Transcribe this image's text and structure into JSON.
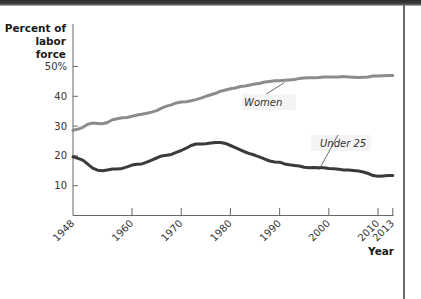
{
  "chart_data": {
    "type": "line",
    "title": "",
    "ylabel": "Percent of labor force",
    "xlabel": "Year",
    "ylim": [
      0,
      50
    ],
    "xlim": [
      1948,
      2013
    ],
    "grid": false,
    "legend": "inline labels",
    "y_ticks": [
      {
        "value": 10,
        "label": "10"
      },
      {
        "value": 20,
        "label": "20"
      },
      {
        "value": 30,
        "label": "30"
      },
      {
        "value": 40,
        "label": "40"
      },
      {
        "value": 50,
        "label": "50%"
      }
    ],
    "x_ticks": [
      {
        "value": 1948,
        "label": "1948"
      },
      {
        "value": 1960,
        "label": "1960"
      },
      {
        "value": 1970,
        "label": "1970"
      },
      {
        "value": 1980,
        "label": "1980"
      },
      {
        "value": 1990,
        "label": "1990"
      },
      {
        "value": 2000,
        "label": "2000"
      },
      {
        "value": 2010,
        "label": "2010"
      },
      {
        "value": 2013,
        "label": "2013"
      }
    ],
    "series": [
      {
        "name": "Women",
        "color": "#8c8c8c",
        "x": [
          1948,
          1949,
          1950,
          1951,
          1952,
          1953,
          1954,
          1955,
          1956,
          1957,
          1958,
          1959,
          1960,
          1961,
          1962,
          1963,
          1964,
          1965,
          1966,
          1967,
          1968,
          1969,
          1970,
          1971,
          1972,
          1973,
          1974,
          1975,
          1976,
          1977,
          1978,
          1979,
          1980,
          1981,
          1982,
          1983,
          1984,
          1985,
          1986,
          1987,
          1988,
          1989,
          1990,
          1991,
          1992,
          1993,
          1994,
          1995,
          1996,
          1997,
          1998,
          1999,
          2000,
          2001,
          2002,
          2003,
          2004,
          2005,
          2006,
          2007,
          2008,
          2009,
          2010,
          2011,
          2012,
          2013
        ],
        "values": [
          28.6,
          29.0,
          29.6,
          30.6,
          31.0,
          30.9,
          30.8,
          31.2,
          32.1,
          32.5,
          32.8,
          32.9,
          33.3,
          33.7,
          34.0,
          34.3,
          34.7,
          35.2,
          36.0,
          36.7,
          37.1,
          37.8,
          38.1,
          38.2,
          38.5,
          38.9,
          39.4,
          40.0,
          40.5,
          41.0,
          41.7,
          42.1,
          42.5,
          42.8,
          43.3,
          43.5,
          43.8,
          44.1,
          44.4,
          44.8,
          45.0,
          45.2,
          45.2,
          45.4,
          45.5,
          45.6,
          46.0,
          46.1,
          46.2,
          46.2,
          46.3,
          46.5,
          46.5,
          46.5,
          46.5,
          46.6,
          46.5,
          46.4,
          46.3,
          46.4,
          46.5,
          46.8,
          46.8,
          46.9,
          47.0,
          47.0
        ]
      },
      {
        "name": "Under 25",
        "color": "#3a3a3a",
        "x": [
          1948,
          1949,
          1950,
          1951,
          1952,
          1953,
          1954,
          1955,
          1956,
          1957,
          1958,
          1959,
          1960,
          1961,
          1962,
          1963,
          1964,
          1965,
          1966,
          1967,
          1968,
          1969,
          1970,
          1971,
          1972,
          1973,
          1974,
          1975,
          1976,
          1977,
          1978,
          1979,
          1980,
          1981,
          1982,
          1983,
          1984,
          1985,
          1986,
          1987,
          1988,
          1989,
          1990,
          1991,
          1992,
          1993,
          1994,
          1995,
          1996,
          1997,
          1998,
          1999,
          2000,
          2001,
          2002,
          2003,
          2004,
          2005,
          2006,
          2007,
          2008,
          2009,
          2010,
          2011,
          2012,
          2013
        ],
        "values": [
          19.7,
          19.2,
          18.6,
          17.2,
          15.9,
          15.2,
          15.0,
          15.3,
          15.6,
          15.6,
          15.8,
          16.3,
          16.9,
          17.2,
          17.3,
          17.9,
          18.6,
          19.3,
          20.0,
          20.2,
          20.5,
          21.2,
          21.8,
          22.6,
          23.5,
          24.0,
          24.0,
          24.1,
          24.3,
          24.5,
          24.5,
          24.2,
          23.5,
          22.8,
          22.0,
          21.3,
          20.7,
          20.2,
          19.6,
          18.9,
          18.3,
          18.0,
          17.9,
          17.3,
          17.0,
          16.8,
          16.6,
          16.2,
          16.0,
          16.1,
          16.0,
          16.0,
          15.8,
          15.7,
          15.5,
          15.3,
          15.3,
          15.1,
          14.9,
          14.6,
          14.1,
          13.4,
          13.2,
          13.3,
          13.4,
          13.4
        ]
      }
    ],
    "annotations": [
      {
        "text": "Women",
        "series": "Women",
        "x": 1991,
        "y": 45.3
      },
      {
        "text": "Under 25",
        "series": "Under 25",
        "x": 1998,
        "y": 16.0
      }
    ]
  },
  "axis_labels": {
    "y": [
      "Percent of",
      "labor force"
    ],
    "x": "Year"
  }
}
